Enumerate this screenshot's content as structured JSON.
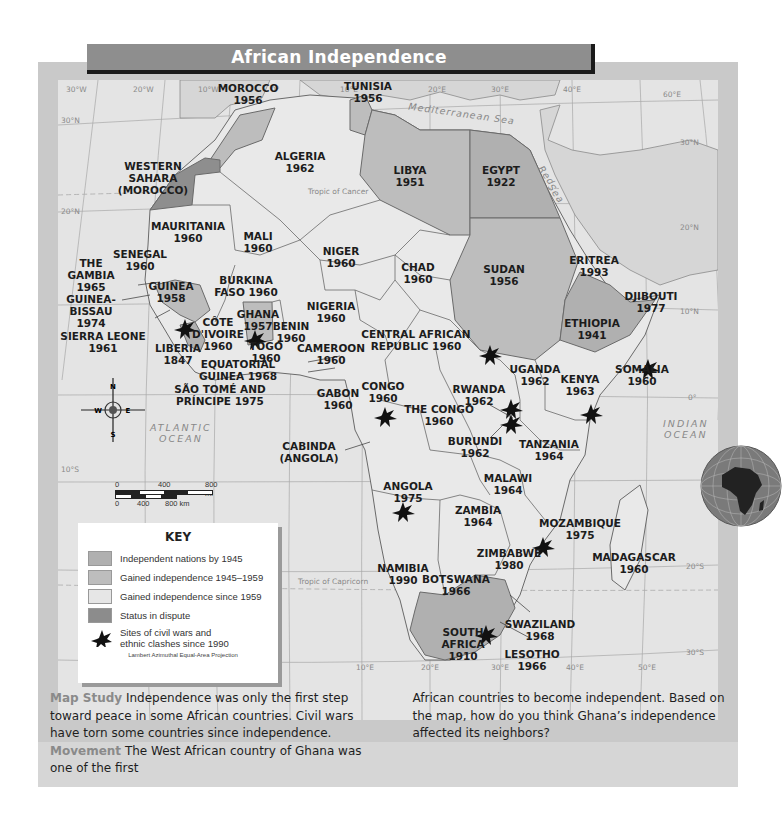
{
  "title": "African Independence",
  "colors": {
    "independent_by_1945": "#b4b4b4",
    "gained_1945_1959": "#bdbdbd",
    "gained_since_1959": "#e4e4e4",
    "status_in_dispute": "#8e8e8e",
    "water": "#e4e4e4",
    "frame": "#c9c9c9",
    "caption_keyword": "#8a8a8a"
  },
  "key": {
    "title": "KEY",
    "items": [
      {
        "label": "Independent nations by 1945",
        "color": "#b0b0b0"
      },
      {
        "label": "Gained independence 1945–1959",
        "color": "#bdbdbd"
      },
      {
        "label": "Gained independence since 1959",
        "color": "#e6e6e6"
      },
      {
        "label": "Status in dispute",
        "color": "#8c8c8c"
      }
    ],
    "conflict_label_line1": "Sites of civil wars and",
    "conflict_label_line2": "ethnic clashes since 1990",
    "projection": "Lambert Azimuthal Equal-Area Projection"
  },
  "grid_labels": {
    "lon_top": [
      "30°W",
      "20°W",
      "10°W",
      "0°",
      "10°E",
      "20°E",
      "30°E",
      "40°E",
      "60°E"
    ],
    "lon_bottom": [
      "0°",
      "10°E",
      "20°E",
      "30°E",
      "40°E",
      "50°E"
    ],
    "lat_left": [
      "30°N",
      "20°N",
      "10°N",
      "0°",
      "10°S"
    ],
    "lat_right": [
      "30°N",
      "20°N",
      "10°N",
      "0°",
      "20°S",
      "30°S"
    ]
  },
  "features": {
    "tropic_cancer": "Tropic of Cancer",
    "tropic_capricorn": "Tropic of Capricorn",
    "mediterranean": "Mediterranean Sea",
    "red_sea_1": "Red",
    "red_sea_2": "Sea",
    "atlantic_1": "ATLANTIC",
    "atlantic_2": "OCEAN",
    "indian_1": "INDIAN",
    "indian_2": "OCEAN"
  },
  "compass": {
    "n": "N",
    "s": "S",
    "e": "E",
    "w": "W"
  },
  "scale": {
    "mi_0": "0",
    "mi_400": "400",
    "mi_800": "800 mi",
    "km_0": "0",
    "km_400": "400",
    "km_800": "800 km"
  },
  "countries": [
    {
      "name": "MOROCCO",
      "year": "1956",
      "category": "gained_1945_1959"
    },
    {
      "name": "TUNISIA",
      "year": "1956",
      "category": "gained_1945_1959"
    },
    {
      "name": "WESTERN SAHARA",
      "year": "(MOROCCO)",
      "category": "status_in_dispute"
    },
    {
      "name": "ALGERIA",
      "year": "1962",
      "category": "gained_since_1959"
    },
    {
      "name": "LIBYA",
      "year": "1951",
      "category": "gained_1945_1959"
    },
    {
      "name": "EGYPT",
      "year": "1922",
      "category": "independent_by_1945"
    },
    {
      "name": "MAURITANIA",
      "year": "1960",
      "category": "gained_since_1959"
    },
    {
      "name": "MALI",
      "year": "1960",
      "category": "gained_since_1959"
    },
    {
      "name": "NIGER",
      "year": "1960",
      "category": "gained_since_1959"
    },
    {
      "name": "CHAD",
      "year": "1960",
      "category": "gained_since_1959"
    },
    {
      "name": "SUDAN",
      "year": "1956",
      "category": "gained_1945_1959",
      "conflict": true
    },
    {
      "name": "ERITREA",
      "year": "1993",
      "category": "gained_since_1959"
    },
    {
      "name": "DJIBOUTI",
      "year": "1977",
      "category": "gained_since_1959"
    },
    {
      "name": "ETHIOPIA",
      "year": "1941",
      "category": "independent_by_1945"
    },
    {
      "name": "SOMALIA",
      "year": "1960",
      "category": "gained_since_1959",
      "conflict": true
    },
    {
      "name": "SENEGAL",
      "year": "1960",
      "category": "gained_since_1959"
    },
    {
      "name": "THE GAMBIA",
      "year": "1965",
      "category": "gained_since_1959"
    },
    {
      "name": "GUINEA-BISSAU",
      "year": "1974",
      "category": "gained_since_1959"
    },
    {
      "name": "GUINEA",
      "year": "1958",
      "category": "gained_1945_1959"
    },
    {
      "name": "SIERRA LEONE",
      "year": "1961",
      "category": "gained_since_1959",
      "conflict": true
    },
    {
      "name": "LIBERIA",
      "year": "1847",
      "category": "independent_by_1945",
      "conflict": true
    },
    {
      "name": "BURKINA FASO",
      "year": "1960",
      "category": "gained_since_1959"
    },
    {
      "name": "CÔTE D'IVOIRE",
      "year": "1960",
      "category": "gained_since_1959"
    },
    {
      "name": "GHANA",
      "year": "1957",
      "category": "gained_1945_1959",
      "conflict": true
    },
    {
      "name": "TOGO",
      "year": "1960",
      "category": "gained_since_1959"
    },
    {
      "name": "BENIN",
      "year": "1960",
      "category": "gained_since_1959"
    },
    {
      "name": "NIGERIA",
      "year": "1960",
      "category": "gained_since_1959"
    },
    {
      "name": "CAMEROON",
      "year": "1960",
      "category": "gained_since_1959"
    },
    {
      "name": "CENTRAL AFRICAN REPUBLIC",
      "year": "1960",
      "category": "gained_since_1959"
    },
    {
      "name": "EQUATORIAL GUINEA",
      "year": "1968",
      "category": "gained_since_1959"
    },
    {
      "name": "SÃO TOMÉ AND PRÍNCIPE",
      "year": "1975",
      "category": "gained_since_1959"
    },
    {
      "name": "GABON",
      "year": "1960",
      "category": "gained_since_1959"
    },
    {
      "name": "CONGO",
      "year": "1960",
      "category": "gained_since_1959",
      "conflict": true
    },
    {
      "name": "THE CONGO",
      "year": "1960",
      "category": "gained_since_1959"
    },
    {
      "name": "CABINDA",
      "year": "(ANGOLA)",
      "category": "gained_since_1959"
    },
    {
      "name": "UGANDA",
      "year": "1962",
      "category": "gained_since_1959"
    },
    {
      "name": "KENYA",
      "year": "1963",
      "category": "gained_since_1959",
      "conflict": true
    },
    {
      "name": "RWANDA",
      "year": "1962",
      "category": "gained_since_1959",
      "conflict": true
    },
    {
      "name": "BURUNDI",
      "year": "1962",
      "category": "gained_since_1959",
      "conflict": true
    },
    {
      "name": "TANZANIA",
      "year": "1964",
      "category": "gained_since_1959"
    },
    {
      "name": "ANGOLA",
      "year": "1975",
      "category": "gained_since_1959",
      "conflict": true
    },
    {
      "name": "MALAWI",
      "year": "1964",
      "category": "gained_since_1959"
    },
    {
      "name": "ZAMBIA",
      "year": "1964",
      "category": "gained_since_1959"
    },
    {
      "name": "MOZAMBIQUE",
      "year": "1975",
      "category": "gained_since_1959",
      "conflict": true
    },
    {
      "name": "ZIMBABWE",
      "year": "1980",
      "category": "gained_since_1959"
    },
    {
      "name": "MADAGASCAR",
      "year": "1960",
      "category": "gained_since_1959"
    },
    {
      "name": "NAMIBIA",
      "year": "1990",
      "category": "gained_since_1959"
    },
    {
      "name": "BOTSWANA",
      "year": "1966",
      "category": "gained_since_1959"
    },
    {
      "name": "SWAZILAND",
      "year": "1968",
      "category": "gained_since_1959"
    },
    {
      "name": "SOUTH AFRICA",
      "year": "1910",
      "category": "independent_by_1945"
    },
    {
      "name": "LESOTHO",
      "year": "1966",
      "category": "gained_since_1959",
      "conflict": true
    }
  ],
  "labels": {
    "morocco": [
      "MOROCCO",
      "1956"
    ],
    "tunisia": [
      "TUNISIA",
      "1956"
    ],
    "wsahara": [
      "WESTERN",
      "SAHARA",
      "(MOROCCO)"
    ],
    "algeria": [
      "ALGERIA",
      "1962"
    ],
    "libya": [
      "LIBYA",
      "1951"
    ],
    "egypt": [
      "EGYPT",
      "1922"
    ],
    "mauritania": [
      "MAURITANIA",
      "1960"
    ],
    "mali": [
      "MALI",
      "1960"
    ],
    "niger": [
      "NIGER",
      "1960"
    ],
    "chad": [
      "CHAD",
      "1960"
    ],
    "sudan": [
      "SUDAN",
      "1956"
    ],
    "eritrea": [
      "ERITREA",
      "1993"
    ],
    "djibouti": [
      "DJIBOUTI",
      "1977"
    ],
    "ethiopia": [
      "ETHIOPIA",
      "1941"
    ],
    "somalia": [
      "SOMALIA",
      "1960"
    ],
    "senegal": [
      "SENEGAL",
      "1960"
    ],
    "gambia": [
      "THE",
      "GAMBIA",
      "1965"
    ],
    "gbissau": [
      "GUINEA-",
      "BISSAU",
      "1974"
    ],
    "guinea": [
      "GUINEA",
      "1958"
    ],
    "sleone": [
      "SIERRA LEONE",
      "1961"
    ],
    "liberia": [
      "LIBERIA",
      "1847"
    ],
    "burkina": [
      "BURKINA",
      "FASO 1960"
    ],
    "cote": [
      "CÔTE",
      "D'IVOIRE",
      "1960"
    ],
    "ghana": [
      "GHANA",
      "1957"
    ],
    "togo": [
      "TOGO",
      "1960"
    ],
    "benin": [
      "BENIN",
      "1960"
    ],
    "nigeria": [
      "NIGERIA",
      "1960"
    ],
    "cameroon": [
      "CAMEROON",
      "1960"
    ],
    "car": [
      "CENTRAL AFRICAN",
      "REPUBLIC 1960"
    ],
    "eqguinea": [
      "EQUATORIAL",
      "GUINEA 1968"
    ],
    "saotome": [
      "SÃO TOMÉ AND",
      "PRÍNCIPE 1975"
    ],
    "gabon": [
      "GABON",
      "1960"
    ],
    "congo": [
      "CONGO",
      "1960"
    ],
    "thecongo": [
      "THE CONGO",
      "1960"
    ],
    "cabinda": [
      "CABINDA",
      "(ANGOLA)"
    ],
    "uganda": [
      "UGANDA",
      "1962"
    ],
    "kenya": [
      "KENYA",
      "1963"
    ],
    "rwanda": [
      "RWANDA",
      "1962"
    ],
    "burundi": [
      "BURUNDI",
      "1962"
    ],
    "tanzania": [
      "TANZANIA",
      "1964"
    ],
    "angola": [
      "ANGOLA",
      "1975"
    ],
    "malawi": [
      "MALAWI",
      "1964"
    ],
    "zambia": [
      "ZAMBIA",
      "1964"
    ],
    "mozambique": [
      "MOZAMBIQUE",
      "1975"
    ],
    "zimbabwe": [
      "ZIMBABWE",
      "1980"
    ],
    "madagascar": [
      "MADAGASCAR",
      "1960"
    ],
    "namibia": [
      "NAMIBIA",
      "1990"
    ],
    "botswana": [
      "BOTSWANA",
      "1966"
    ],
    "swaziland": [
      "SWAZILAND",
      "1968"
    ],
    "safrica": [
      "SOUTH",
      "AFRICA",
      "1910"
    ],
    "lesotho": [
      "LESOTHO",
      "1966"
    ]
  },
  "caption": {
    "kw1": "Map Study",
    "text1": " Independence was only the first step toward peace in some African countries. Civil wars have torn some countries since independence. ",
    "kw2": "Movement",
    "text2": " The West African country of Ghana was one of the first",
    "text3": "African countries to become independent. Based on the map, how do you think Ghana’s independence affected its neighbors?"
  }
}
